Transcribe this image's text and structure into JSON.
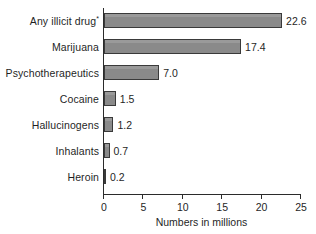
{
  "chart_data": {
    "type": "bar",
    "orientation": "horizontal",
    "title": "",
    "xlabel": "Numbers in millions",
    "ylabel": "",
    "xlim": [
      0,
      25
    ],
    "xticks": [
      0,
      5,
      10,
      15,
      20,
      25
    ],
    "xtick_labels": [
      "0",
      "5",
      "10",
      "15",
      "20",
      "25"
    ],
    "grid": false,
    "legend": null,
    "categories": [
      "Any illicit drug",
      "Marijuana",
      "Psychotherapeutics",
      "Cocaine",
      "Hallucinogens",
      "Inhalants",
      "Heroin"
    ],
    "values": [
      22.6,
      17.4,
      7.0,
      1.5,
      1.2,
      0.7,
      0.2
    ],
    "value_labels": [
      "22.6",
      "17.4",
      "7.0",
      "1.5",
      "1.2",
      "0.7",
      "0.2"
    ],
    "annotations": [
      {
        "target": "Any illicit drug",
        "marker": "*"
      }
    ],
    "colors": {
      "bar_fill": "#8a8a8a",
      "bar_border": "#3a3a3a",
      "axis": "#2b2b2b",
      "text": "#1f1f1f",
      "background": "#ffffff"
    }
  },
  "rows": [
    {
      "label": "Any illicit drug",
      "sup": "*",
      "value": 22.6,
      "value_label": "22.6"
    },
    {
      "label": "Marijuana",
      "sup": "",
      "value": 17.4,
      "value_label": "17.4"
    },
    {
      "label": "Psychotherapeutics",
      "sup": "",
      "value": 7.0,
      "value_label": "7.0"
    },
    {
      "label": "Cocaine",
      "sup": "",
      "value": 1.5,
      "value_label": "1.5"
    },
    {
      "label": "Hallucinogens",
      "sup": "",
      "value": 1.2,
      "value_label": "1.2"
    },
    {
      "label": "Inhalants",
      "sup": "",
      "value": 0.7,
      "value_label": "0.7"
    },
    {
      "label": "Heroin",
      "sup": "",
      "value": 0.2,
      "value_label": "0.2"
    }
  ],
  "axis": {
    "title": "Numbers in millions",
    "ticks": [
      "0",
      "5",
      "10",
      "15",
      "20",
      "25"
    ]
  }
}
